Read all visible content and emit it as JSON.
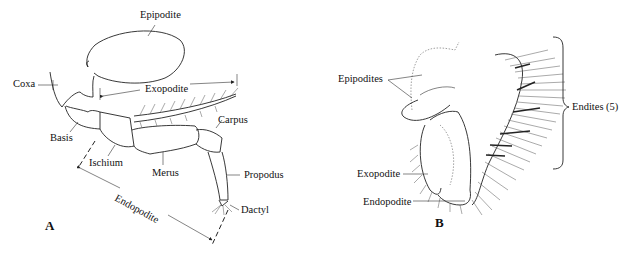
{
  "figure": {
    "panel_a": {
      "letter": "A",
      "labels": {
        "epipodite": "Epipodite",
        "coxa": "Coxa",
        "exopodite": "Exopodite",
        "basis": "Basis",
        "ischium": "Ischium",
        "merus": "Merus",
        "carpus": "Carpus",
        "propodus": "Propodus",
        "dactyl": "Dactyl",
        "endopodite": "Endopodite"
      }
    },
    "panel_b": {
      "letter": "B",
      "labels": {
        "epipodites": "Epipodites",
        "endites": "Endites (5)",
        "exopodite": "Exopodite",
        "endopodite": "Endopodite"
      }
    }
  }
}
